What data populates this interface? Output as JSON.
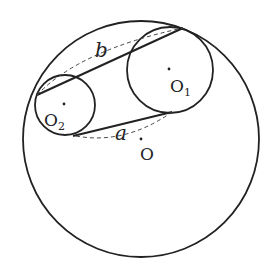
{
  "diagram": {
    "colors": {
      "stroke": "#222222",
      "background": "#ffffff"
    },
    "circles": [
      {
        "id": "O",
        "cx": 141,
        "cy": 139,
        "r": 118
      },
      {
        "id": "O1",
        "cx": 170,
        "cy": 70,
        "r": 43
      },
      {
        "id": "O2",
        "cx": 65,
        "cy": 105,
        "r": 30
      }
    ],
    "labels": {
      "o": "O",
      "o1_main": "O",
      "o1_sub": "1",
      "o2_main": "O",
      "o2_sub": "2",
      "a": "a",
      "b": "b"
    },
    "lines": {
      "upper_tangent": {
        "x1": 37,
        "y1": 95,
        "x2": 183,
        "y2": 28
      },
      "lower_tangent": {
        "x1": 73,
        "y1": 136,
        "x2": 172,
        "y2": 112
      }
    }
  }
}
